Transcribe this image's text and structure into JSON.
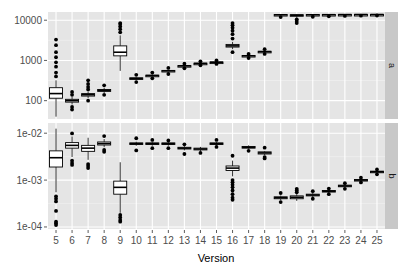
{
  "chart_data": {
    "type": "boxplot",
    "title": "",
    "xlabel": "Version",
    "ylabel": "",
    "facet_strips": [
      "a",
      "b"
    ],
    "categories": [
      "5",
      "6",
      "7",
      "8",
      "9",
      "10",
      "11",
      "12",
      "13",
      "14",
      "15",
      "16",
      "17",
      "18",
      "19",
      "20",
      "21",
      "22",
      "23",
      "24",
      "25"
    ],
    "panels": [
      {
        "strip": "a",
        "yscale": "log10",
        "ylim": [
          35,
          16000
        ],
        "yticks": [
          100,
          1000,
          10000
        ],
        "ytick_labels": [
          "100",
          "1000",
          "10000"
        ],
        "boxes": [
          {
            "x": "5",
            "q1": 115,
            "median": 150,
            "q3": 210,
            "lo": 40,
            "hi": 320,
            "outliers": [
              400,
              500,
              700,
              900,
              1200,
              1600,
              2400,
              3300
            ]
          },
          {
            "x": "6",
            "q1": 92,
            "median": 100,
            "q3": 108,
            "lo": 80,
            "hi": 125,
            "outliers": [
              60,
              70,
              140,
              165
            ]
          },
          {
            "x": "7",
            "q1": 130,
            "median": 140,
            "q3": 150,
            "lo": 115,
            "hi": 170,
            "outliers": [
              100,
              190,
              220,
              260,
              320
            ]
          },
          {
            "x": "8",
            "q1": 170,
            "median": 180,
            "q3": 190,
            "lo": 155,
            "hi": 210,
            "outliers": [
              140,
              240
            ]
          },
          {
            "x": "9",
            "q1": 1300,
            "median": 1600,
            "q3": 2300,
            "lo": 550,
            "hi": 4200,
            "outliers": [
              5000,
              6000,
              7000,
              8000,
              8500
            ]
          },
          {
            "x": "10",
            "q1": 340,
            "median": 355,
            "q3": 370,
            "lo": 320,
            "hi": 390,
            "outliers": [
              290,
              440
            ]
          },
          {
            "x": "11",
            "q1": 410,
            "median": 420,
            "q3": 430,
            "lo": 390,
            "hi": 450,
            "outliers": [
              360,
              500
            ]
          },
          {
            "x": "12",
            "q1": 535,
            "median": 550,
            "q3": 565,
            "lo": 510,
            "hi": 590,
            "outliers": [
              460,
              650
            ]
          },
          {
            "x": "13",
            "q1": 715,
            "median": 730,
            "q3": 745,
            "lo": 690,
            "hi": 770,
            "outliers": [
              640,
              830
            ]
          },
          {
            "x": "14",
            "q1": 825,
            "median": 840,
            "q3": 855,
            "lo": 800,
            "hi": 880,
            "outliers": [
              760,
              950
            ]
          },
          {
            "x": "15",
            "q1": 885,
            "median": 900,
            "q3": 915,
            "lo": 860,
            "hi": 940,
            "outliers": [
              820,
              1000
            ]
          },
          {
            "x": "16",
            "q1": 2150,
            "median": 2300,
            "q3": 2500,
            "lo": 1900,
            "hi": 2900,
            "outliers": [
              1600,
              3500,
              4500,
              5500,
              6500,
              7500,
              8500
            ]
          },
          {
            "x": "17",
            "q1": 1270,
            "median": 1300,
            "q3": 1330,
            "lo": 1220,
            "hi": 1380,
            "outliers": [
              1150,
              1450
            ]
          },
          {
            "x": "18",
            "q1": 1610,
            "median": 1650,
            "q3": 1690,
            "lo": 1550,
            "hi": 1750,
            "outliers": [
              1450,
              1900
            ]
          },
          {
            "x": "19",
            "q1": 13300,
            "median": 13600,
            "q3": 13900,
            "lo": 12900,
            "hi": 14100,
            "outliers": [
              12000
            ]
          },
          {
            "x": "20",
            "q1": 12700,
            "median": 13300,
            "q3": 13700,
            "lo": 11500,
            "hi": 14000,
            "outliers": [
              8500,
              9500,
              10500
            ]
          },
          {
            "x": "21",
            "q1": 13400,
            "median": 13650,
            "q3": 13900,
            "lo": 13000,
            "hi": 14100,
            "outliers": [
              12200
            ]
          },
          {
            "x": "22",
            "q1": 13450,
            "median": 13700,
            "q3": 13900,
            "lo": 13100,
            "hi": 14100,
            "outliers": [
              12500
            ]
          },
          {
            "x": "23",
            "q1": 13500,
            "median": 13750,
            "q3": 13950,
            "lo": 13200,
            "hi": 14100,
            "outliers": [
              12800
            ]
          },
          {
            "x": "24",
            "q1": 13550,
            "median": 13800,
            "q3": 13950,
            "lo": 13300,
            "hi": 14100,
            "outliers": [
              13000
            ]
          },
          {
            "x": "25",
            "q1": 13600,
            "median": 13800,
            "q3": 13950,
            "lo": 13350,
            "hi": 14100,
            "outliers": [
              13100
            ]
          }
        ]
      },
      {
        "strip": "b",
        "yscale": "log10",
        "ylim": [
          9.05e-05,
          0.0165
        ],
        "yticks": [
          0.0001,
          0.001,
          0.01
        ],
        "ytick_labels": [
          "1e-04",
          "1e-03",
          "1e-02"
        ],
        "boxes": [
          {
            "x": "5",
            "q1": 0.0019,
            "median": 0.003,
            "q3": 0.0042,
            "lo": 0.00055,
            "hi": 0.0125,
            "outliers": [
              0.00045,
              0.0004,
              0.00035,
              0.00022,
              0.00013,
              0.00012,
              0.00011
            ]
          },
          {
            "x": "6",
            "q1": 0.0048,
            "median": 0.0055,
            "q3": 0.0063,
            "lo": 0.0031,
            "hi": 0.0085,
            "outliers": [
              0.0026,
              0.0023,
              0.0021,
              0.0099
            ]
          },
          {
            "x": "7",
            "q1": 0.0041,
            "median": 0.0048,
            "q3": 0.0055,
            "lo": 0.0027,
            "hi": 0.008,
            "outliers": [
              0.0022,
              0.002,
              0.0018
            ]
          },
          {
            "x": "8",
            "q1": 0.0056,
            "median": 0.006,
            "q3": 0.0065,
            "lo": 0.005,
            "hi": 0.0075,
            "outliers": [
              0.0044,
              0.004,
              0.0087
            ]
          },
          {
            "x": "9",
            "q1": 0.0005,
            "median": 0.0007,
            "q3": 0.00095,
            "lo": 0.0002,
            "hi": 0.0024,
            "outliers": [
              0.00018,
              0.00016,
              0.00014,
              0.00013
            ]
          },
          {
            "x": "10",
            "q1": 0.0058,
            "median": 0.006,
            "q3": 0.0062,
            "lo": 0.0054,
            "hi": 0.0066,
            "outliers": [
              0.0043,
              0.0078
            ]
          },
          {
            "x": "11",
            "q1": 0.0058,
            "median": 0.006,
            "q3": 0.0062,
            "lo": 0.0054,
            "hi": 0.0066,
            "outliers": [
              0.0048,
              0.0072
            ]
          },
          {
            "x": "12",
            "q1": 0.0058,
            "median": 0.006,
            "q3": 0.0062,
            "lo": 0.0054,
            "hi": 0.0066,
            "outliers": [
              0.0048,
              0.007
            ]
          },
          {
            "x": "13",
            "q1": 0.0046,
            "median": 0.0048,
            "q3": 0.005,
            "lo": 0.0043,
            "hi": 0.0053,
            "outliers": [
              0.0036,
              0.0058
            ]
          },
          {
            "x": "14",
            "q1": 0.0044,
            "median": 0.0046,
            "q3": 0.0048,
            "lo": 0.0041,
            "hi": 0.0051,
            "outliers": [
              0.0038
            ]
          },
          {
            "x": "15",
            "q1": 0.0058,
            "median": 0.006,
            "q3": 0.0062,
            "lo": 0.0055,
            "hi": 0.0065,
            "outliers": [
              0.0051,
              0.0072
            ]
          },
          {
            "x": "16",
            "q1": 0.0016,
            "median": 0.0018,
            "q3": 0.002,
            "lo": 0.0012,
            "hi": 0.0026,
            "outliers": [
              0.0033,
              0.001,
              0.0009,
              0.0008,
              0.0007,
              0.0006,
              0.0005,
              0.00042,
              0.00038
            ]
          },
          {
            "x": "17",
            "q1": 0.0048,
            "median": 0.005,
            "q3": 0.0052,
            "lo": 0.0045,
            "hi": 0.0055,
            "outliers": [
              0.0042
            ]
          },
          {
            "x": "18",
            "q1": 0.0036,
            "median": 0.0038,
            "q3": 0.004,
            "lo": 0.0034,
            "hi": 0.0042,
            "outliers": [
              0.0029,
              0.0031,
              0.0049
            ]
          },
          {
            "x": "19",
            "q1": 0.0004,
            "median": 0.00042,
            "q3": 0.00044,
            "lo": 0.00037,
            "hi": 0.00047,
            "outliers": [
              0.00034,
              0.00053
            ]
          },
          {
            "x": "20",
            "q1": 0.0004,
            "median": 0.00043,
            "q3": 0.00046,
            "lo": 0.00036,
            "hi": 0.0005,
            "outliers": [
              0.00055,
              0.0006,
              0.00065
            ]
          },
          {
            "x": "21",
            "q1": 0.00046,
            "median": 0.00048,
            "q3": 0.0005,
            "lo": 0.00043,
            "hi": 0.00053,
            "outliers": [
              0.0004,
              0.00058
            ]
          },
          {
            "x": "22",
            "q1": 0.00056,
            "median": 0.00058,
            "q3": 0.0006,
            "lo": 0.00053,
            "hi": 0.00063,
            "outliers": [
              0.0005,
              0.00066
            ]
          },
          {
            "x": "23",
            "q1": 0.00072,
            "median": 0.00075,
            "q3": 0.00078,
            "lo": 0.00069,
            "hi": 0.00081,
            "outliers": [
              0.00065,
              0.00086
            ]
          },
          {
            "x": "24",
            "q1": 0.00097,
            "median": 0.001,
            "q3": 0.00103,
            "lo": 0.00093,
            "hi": 0.00107,
            "outliers": [
              0.00089,
              0.00112
            ]
          },
          {
            "x": "25",
            "q1": 0.00145,
            "median": 0.0015,
            "q3": 0.00155,
            "lo": 0.0014,
            "hi": 0.0016,
            "outliers": [
              0.00133,
              0.00168
            ]
          }
        ]
      }
    ],
    "grid": true,
    "legend": "none"
  },
  "style": {
    "panel_bg": "#e5e5e5",
    "grid_major": "#ffffff",
    "grid_minor": "#f2f2f2",
    "strip_bg": "#c8c8c8",
    "box_fill": "#ffffff",
    "ink": "#000000",
    "tick_text": "#4d4d4d"
  }
}
